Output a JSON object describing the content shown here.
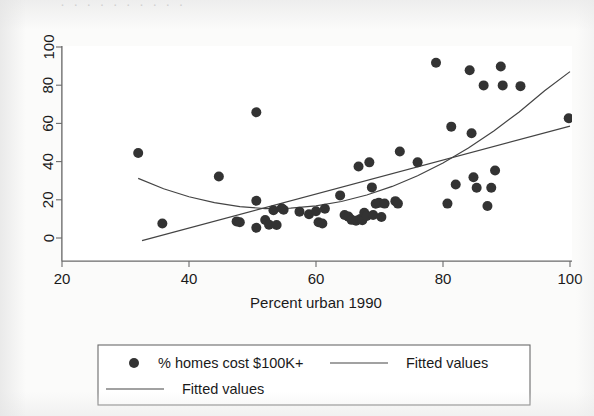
{
  "figure": {
    "background_color": "#fbfbfa",
    "ink_color": "#2b2b2b",
    "top_cut_text": "· · · · · · · · · ·"
  },
  "axes": {
    "x_ticks": [
      "20",
      "40",
      "60",
      "80",
      "100"
    ],
    "y_ticks": [
      "0",
      "20",
      "40",
      "60",
      "80",
      "100"
    ],
    "x_title": "Percent urban 1990",
    "y_title": ""
  },
  "legend": {
    "entries": [
      {
        "label": "% homes cost $100K+",
        "marker": "circle-marker",
        "row": 0,
        "col": 0
      },
      {
        "label": "Fitted values",
        "marker": "line-marker",
        "row": 0,
        "col": 1
      },
      {
        "label": "Fitted values",
        "marker": "line-marker",
        "row": 1,
        "col": 0
      }
    ]
  },
  "chart_data": {
    "type": "scatter",
    "title": "",
    "xlabel": "Percent urban 1990",
    "ylabel": "",
    "xlim": [
      20,
      100
    ],
    "ylim": [
      0,
      100
    ],
    "xticks": [
      20,
      40,
      60,
      80,
      100
    ],
    "yticks": [
      0,
      20,
      40,
      60,
      80,
      100
    ],
    "grid": false,
    "legend_position": "below-axes",
    "series": [
      {
        "name": "% homes cost $100K+",
        "type": "scatter",
        "marker": "filled-circle",
        "color": "#333333",
        "points": [
          [
            32.0,
            44.5
          ],
          [
            35.8,
            7.6
          ],
          [
            44.7,
            32.2
          ],
          [
            50.6,
            65.8
          ],
          [
            50.6,
            19.5
          ],
          [
            50.6,
            5.4
          ],
          [
            47.5,
            8.7
          ],
          [
            48.0,
            8.2
          ],
          [
            52.0,
            9.4
          ],
          [
            52.6,
            7.0
          ],
          [
            53.3,
            14.5
          ],
          [
            53.8,
            6.8
          ],
          [
            54.6,
            15.6
          ],
          [
            54.9,
            14.8
          ],
          [
            57.4,
            13.8
          ],
          [
            58.9,
            12.4
          ],
          [
            60.0,
            14.0
          ],
          [
            60.4,
            8.2
          ],
          [
            61.0,
            7.6
          ],
          [
            61.4,
            15.3
          ],
          [
            63.8,
            22.3
          ],
          [
            64.5,
            12.0
          ],
          [
            65.1,
            11.2
          ],
          [
            65.6,
            9.5
          ],
          [
            66.3,
            9.0
          ],
          [
            66.7,
            37.4
          ],
          [
            67.0,
            10.0
          ],
          [
            67.3,
            9.3
          ],
          [
            67.6,
            13.2
          ],
          [
            68.0,
            11.5
          ],
          [
            68.4,
            39.6
          ],
          [
            68.8,
            26.5
          ],
          [
            69.0,
            12.0
          ],
          [
            69.4,
            17.9
          ],
          [
            69.9,
            18.4
          ],
          [
            70.3,
            11.0
          ],
          [
            70.8,
            18.0
          ],
          [
            72.5,
            19.3
          ],
          [
            72.9,
            18.0
          ],
          [
            73.2,
            45.3
          ],
          [
            76.0,
            39.6
          ],
          [
            78.9,
            91.8
          ],
          [
            80.7,
            18.0
          ],
          [
            81.3,
            58.3
          ],
          [
            82.0,
            28.0
          ],
          [
            84.2,
            87.8
          ],
          [
            84.5,
            54.8
          ],
          [
            84.8,
            31.8
          ],
          [
            85.3,
            26.3
          ],
          [
            86.4,
            79.9
          ],
          [
            87.0,
            16.8
          ],
          [
            87.6,
            26.3
          ],
          [
            88.2,
            35.3
          ],
          [
            89.1,
            89.8
          ],
          [
            89.4,
            79.9
          ],
          [
            92.2,
            79.5
          ],
          [
            99.8,
            62.7
          ]
        ]
      },
      {
        "name": "Fitted values",
        "type": "line",
        "shape": "quadratic",
        "color": "#444444",
        "points": [
          [
            32.0,
            31.2
          ],
          [
            36.0,
            25.8
          ],
          [
            40.0,
            21.6
          ],
          [
            44.0,
            18.5
          ],
          [
            48.0,
            16.4
          ],
          [
            52.0,
            15.4
          ],
          [
            56.0,
            15.6
          ],
          [
            60.0,
            16.8
          ],
          [
            64.0,
            19.1
          ],
          [
            68.0,
            22.5
          ],
          [
            72.0,
            27.0
          ],
          [
            76.0,
            32.6
          ],
          [
            80.0,
            39.3
          ],
          [
            84.0,
            47.1
          ],
          [
            88.0,
            56.0
          ],
          [
            92.0,
            66.0
          ],
          [
            96.0,
            77.1
          ],
          [
            100.0,
            87.1
          ]
        ]
      },
      {
        "name": "Fitted values",
        "type": "line",
        "shape": "linear",
        "color": "#444444",
        "points": [
          [
            32.6,
            -1.4
          ],
          [
            100.0,
            58.6
          ]
        ]
      }
    ]
  }
}
